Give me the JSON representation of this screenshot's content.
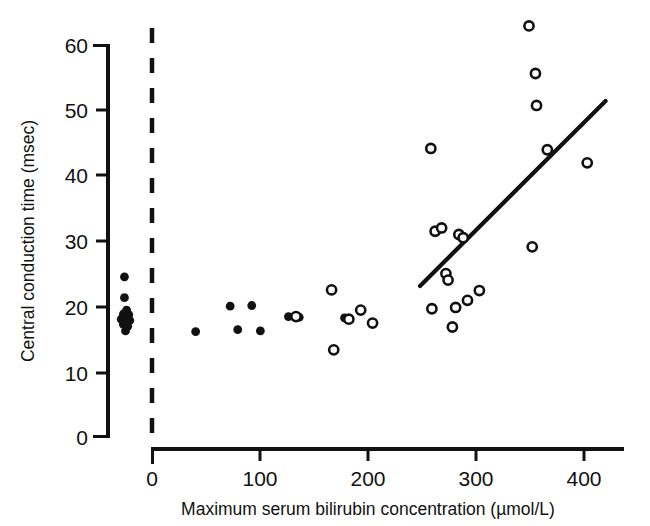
{
  "chart_data": {
    "type": "scatter",
    "title": "",
    "xlabel": "Maximum serum bilirubin concentration (µmol/L)",
    "ylabel": "Central conduction time (msec)",
    "xlim": [
      -50,
      430
    ],
    "ylim": [
      0,
      63
    ],
    "xticks": [
      0,
      100,
      200,
      300,
      400
    ],
    "xticklabels": [
      "0",
      "100",
      "200",
      "300",
      "400"
    ],
    "yticks": [
      0,
      10,
      20,
      30,
      40,
      50,
      60
    ],
    "yticklabels": [
      "0",
      "10",
      "20",
      "30",
      "40",
      "50",
      "60"
    ],
    "grid": false,
    "legend": null,
    "annotations": [
      {
        "name": "zero-reference-dashed-line",
        "type": "vline",
        "x": 0,
        "style": "dashed"
      },
      {
        "name": "regression-line",
        "type": "line",
        "x": [
          248,
          420
        ],
        "y": [
          23.1,
          51.5
        ],
        "style": "solid"
      }
    ],
    "series": [
      {
        "name": "filled-circles",
        "marker": "filled-circle",
        "points": [
          [
            -26,
            24.5
          ],
          [
            -26,
            21.3
          ],
          [
            -24,
            19.4
          ],
          [
            -27,
            18.8
          ],
          [
            -22,
            18.7
          ],
          [
            -29,
            18.0
          ],
          [
            -25,
            17.9
          ],
          [
            -21,
            17.8
          ],
          [
            -27,
            17.2
          ],
          [
            -23,
            16.9
          ],
          [
            -25,
            16.2
          ],
          [
            40,
            16.1
          ],
          [
            72,
            20.0
          ],
          [
            79,
            16.4
          ],
          [
            92,
            20.1
          ],
          [
            100,
            16.2
          ],
          [
            126,
            18.4
          ],
          [
            136,
            18.3
          ],
          [
            178,
            18.2
          ]
        ]
      },
      {
        "name": "open-circles",
        "marker": "open-circle",
        "points": [
          [
            133,
            18.4
          ],
          [
            166,
            22.5
          ],
          [
            168,
            13.3
          ],
          [
            182,
            18.0
          ],
          [
            193,
            19.4
          ],
          [
            204,
            17.4
          ],
          [
            258,
            44.2
          ],
          [
            259,
            19.6
          ],
          [
            262,
            31.5
          ],
          [
            268,
            32.0
          ],
          [
            272,
            25.0
          ],
          [
            274,
            24.0
          ],
          [
            278,
            16.8
          ],
          [
            281,
            19.8
          ],
          [
            284,
            31.0
          ],
          [
            288,
            30.5
          ],
          [
            292,
            20.9
          ],
          [
            303,
            22.4
          ],
          [
            349,
            63.0
          ],
          [
            352,
            29.1
          ],
          [
            355,
            55.7
          ],
          [
            356,
            50.8
          ],
          [
            366,
            44.0
          ],
          [
            403,
            42.0
          ]
        ]
      }
    ]
  }
}
